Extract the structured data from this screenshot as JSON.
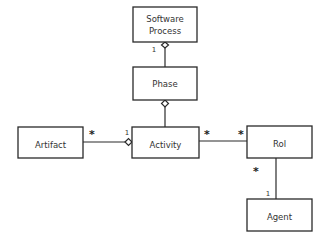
{
  "diagram": {
    "type": "UML class diagram",
    "classes": {
      "software_process": {
        "label_line1": "Software",
        "label_line2": "Process"
      },
      "phase": {
        "label": "Phase"
      },
      "activity": {
        "label": "Activity"
      },
      "artifact": {
        "label": "Artifact"
      },
      "rol": {
        "label": "Rol"
      },
      "agent": {
        "label": "Agent"
      }
    },
    "associations": [
      {
        "from": "Phase",
        "to": "Software Process",
        "kind": "aggregation",
        "whole": "Software Process",
        "multiplicity_whole": "1"
      },
      {
        "from": "Activity",
        "to": "Phase",
        "kind": "aggregation",
        "whole": "Phase"
      },
      {
        "from": "Artifact",
        "to": "Activity",
        "kind": "aggregation",
        "whole": "Activity",
        "multiplicity_part": "*",
        "multiplicity_whole": "1"
      },
      {
        "from": "Activity",
        "to": "Rol",
        "kind": "association",
        "multiplicity_from": "*",
        "multiplicity_to": "*"
      },
      {
        "from": "Rol",
        "to": "Agent",
        "kind": "association",
        "multiplicity_from": "*",
        "multiplicity_to": "1"
      }
    ],
    "multiplicities": {
      "sp_phase_one": "1",
      "artifact_star": "*",
      "artifact_activity_one": "1",
      "activity_rol_star_left": "*",
      "activity_rol_star_right": "*",
      "rol_agent_star": "*",
      "rol_agent_one": "1"
    }
  }
}
